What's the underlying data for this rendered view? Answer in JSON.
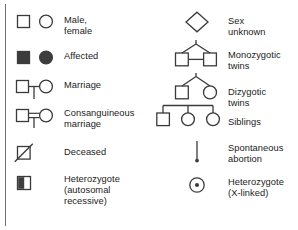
{
  "figure": {
    "kind": "pedigree-symbol-legend",
    "stroke_color": "#3a3a3a",
    "fill_color": "#3d3d3d",
    "text_color": "#1b1b1b",
    "background": "#ffffff"
  },
  "columns": {
    "left": {
      "entries": [
        {
          "id": "male-female",
          "symbol": "open-square-and-open-circle",
          "label": "Male, female"
        },
        {
          "id": "affected",
          "symbol": "filled-square-and-filled-circle",
          "label": "Affected"
        },
        {
          "id": "marriage",
          "symbol": "square-line-circle-with-descent",
          "label": "Marriage"
        },
        {
          "id": "consanguineous",
          "symbol": "square-doubleline-circle-with-descent",
          "label": "Consanguineous\nmarriage"
        },
        {
          "id": "deceased",
          "symbol": "square-with-diagonal-slash",
          "label": "Deceased"
        },
        {
          "id": "heterozygote-auto",
          "symbol": "square-half-filled",
          "label": "Heterozygote\n(autosomal\nrecessive)"
        }
      ]
    },
    "right": {
      "entries": [
        {
          "id": "sex-unknown",
          "symbol": "open-diamond",
          "label": "Sex unknown"
        },
        {
          "id": "monozygotic-twins",
          "symbol": "twin-fork-two-squares-joined",
          "label": "Monozygotic\ntwins"
        },
        {
          "id": "dizygotic-twins",
          "symbol": "twin-fork-square-and-circle",
          "label": "Dizygotic twins"
        },
        {
          "id": "siblings",
          "symbol": "sibship-bar-square-circle-circle",
          "label": "Siblings"
        },
        {
          "id": "spontaneous-abortion",
          "symbol": "vertical-line-with-dot",
          "label": "Spontaneous\nabortion"
        },
        {
          "id": "heterozygote-x",
          "symbol": "circle-with-center-dot",
          "label": "Heterozygote\n(X-linked)"
        }
      ]
    }
  }
}
